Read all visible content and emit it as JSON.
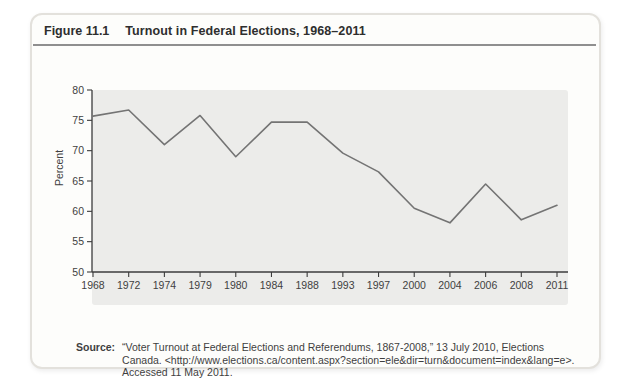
{
  "header": {
    "figure_label": "Figure 11.1",
    "title": "Turnout in Federal Elections, 1968–2011"
  },
  "chart_data": {
    "type": "line",
    "title": "Turnout in Federal Elections, 1968–2011",
    "xlabel": "",
    "ylabel": "Percent",
    "ylim": [
      50,
      80
    ],
    "yticks": [
      50,
      55,
      60,
      65,
      70,
      75,
      80
    ],
    "categories": [
      "1968",
      "1972",
      "1974",
      "1979",
      "1980",
      "1984",
      "1988",
      "1993",
      "1997",
      "2000",
      "2004",
      "2006",
      "2008",
      "2011"
    ],
    "values": [
      75.7,
      76.7,
      71.0,
      75.8,
      69.0,
      74.7,
      74.7,
      69.6,
      66.5,
      60.5,
      58.1,
      64.5,
      58.6,
      61.0
    ],
    "series_name": "Voter turnout (percent)",
    "grid": false,
    "legend": null,
    "colors": {
      "line": "#747474",
      "plot_bg": "#ececea",
      "axis": "#3c3c3c",
      "text": "#3f3f3f"
    }
  },
  "source": {
    "label": "Source:",
    "lines": [
      "“Voter Turnout at Federal Elections and Referendums, 1867-2008,” 13 July 2010, Elections",
      "Canada. <http://www.elections.ca/content.aspx?section=ele&dir=turn&document=index&lang=e>.",
      "Accessed 11 May 2011."
    ]
  },
  "colors": {
    "page_bg": "#ffffff",
    "panel_bg": "#fdfdfb",
    "panel_border": "#e3e1dc",
    "header_rule": "#8f8f8f",
    "title_text": "#2e2e2e"
  }
}
